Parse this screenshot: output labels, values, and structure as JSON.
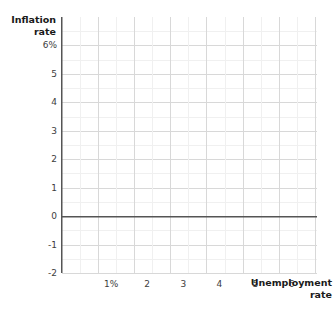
{
  "chart_data": {
    "type": "scatter",
    "title": "",
    "subtitle": "",
    "xlabel": "Unemployment\nrate",
    "ylabel": "Inflation\nrate",
    "x": [],
    "values": [],
    "series": [],
    "annotations": [],
    "legend": [],
    "legend_position": "none",
    "grid": true,
    "grid_minor": true,
    "xlim": [
      0,
      7.06
    ],
    "ylim": [
      -2,
      7
    ],
    "xticks": [
      1,
      2,
      3,
      4,
      5,
      6
    ],
    "yticks": [
      6,
      5,
      4,
      3,
      2,
      1,
      0,
      -1,
      -2
    ],
    "xticklabels": [
      "1%",
      "2",
      "3",
      "4",
      "5",
      "6"
    ],
    "yticklabels": [
      "6%",
      "5",
      "4",
      "3",
      "2",
      "1",
      "0",
      "-1",
      "-2"
    ],
    "zero_line": 0
  },
  "colors": {
    "background": "#ffffff",
    "gridline_major": "#d8d8d8",
    "gridline_minor": "#f0f0f0",
    "axis_line": "#555555",
    "tick_text": "#3d3d3d",
    "title_text": "#1a1a1a"
  }
}
